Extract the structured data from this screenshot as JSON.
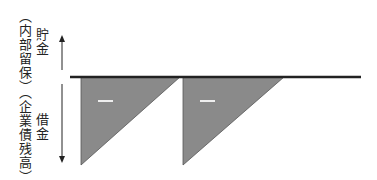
{
  "labels": {
    "upper_main": "貯金",
    "upper_sub": "（内部留保）",
    "lower_main": "借金",
    "lower_sub": "（企業債残高）"
  },
  "signs": {
    "triangle_1": "－",
    "triangle_2": "－"
  },
  "colors": {
    "baseline": "#222222",
    "triangle_fill": "#8a8a8a",
    "triangle_stroke": "#555555",
    "arrow": "#222222",
    "sign": "#eeeeee"
  }
}
